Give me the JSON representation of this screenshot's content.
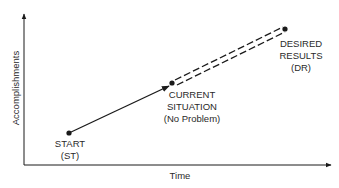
{
  "diagram": {
    "axes": {
      "y_label": "Accomplishments",
      "x_label": "Time"
    },
    "points": {
      "start": {
        "lines": [
          "START",
          "(ST)"
        ]
      },
      "current": {
        "lines": [
          "CURRENT",
          "SITUATION",
          "(No Problem)"
        ]
      },
      "desired": {
        "lines": [
          "DESIRED",
          "RESULTS",
          "(DR)"
        ]
      }
    },
    "connections": [
      {
        "from": "start",
        "to": "current",
        "style": "solid-arrow"
      },
      {
        "from": "current",
        "to": "desired",
        "style": "double-dashed"
      }
    ],
    "colors": {
      "ink": "#1a1a1a",
      "background": "#ffffff"
    }
  }
}
